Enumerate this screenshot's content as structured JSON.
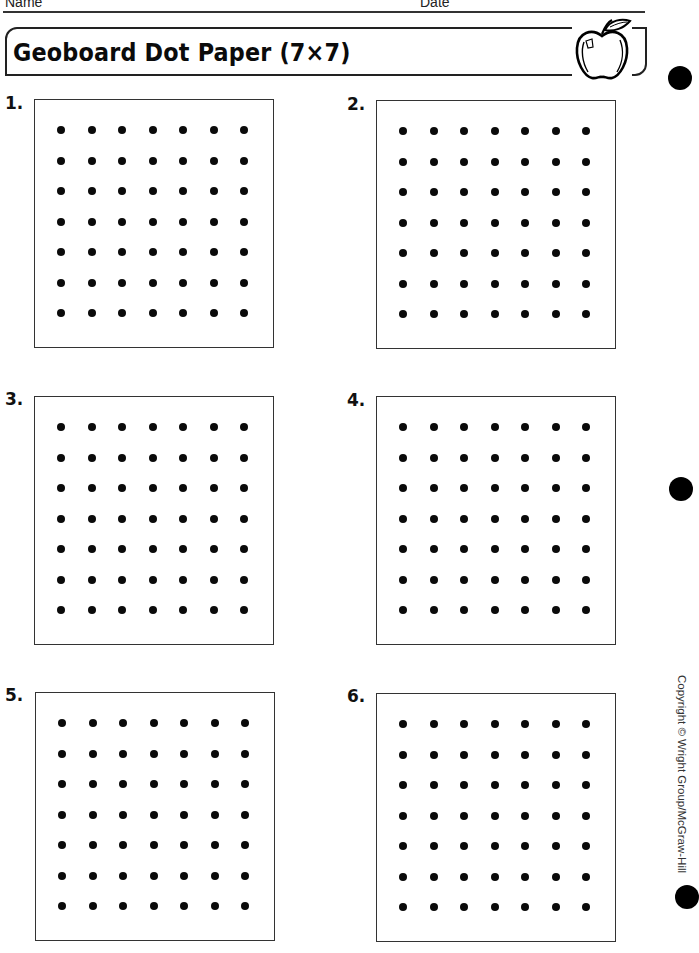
{
  "header": {
    "name_label": "Name",
    "date_label": "Date"
  },
  "banner": {
    "title": "Geoboard Dot Paper (7×7)",
    "icon": "apple-icon"
  },
  "grid": {
    "rows": 7,
    "columns": 7
  },
  "panels": [
    {
      "label": "1."
    },
    {
      "label": "2."
    },
    {
      "label": "3."
    },
    {
      "label": "4."
    },
    {
      "label": "5."
    },
    {
      "label": "6."
    }
  ],
  "footer": {
    "copyright": "Copyright © Wright Group/McGraw-Hill"
  },
  "decor": {
    "hole_punch_icon": "hole-punch-icon",
    "ink_color": "#000000",
    "paper_color": "#ffffff"
  }
}
